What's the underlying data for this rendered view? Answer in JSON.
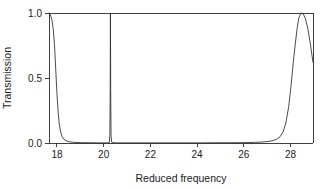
{
  "chart_data": {
    "type": "line",
    "title": "",
    "xlabel": "Reduced frequency",
    "ylabel": "Transmission",
    "xlim": [
      17.66,
      28.96
    ],
    "ylim": [
      0.0,
      1.0
    ],
    "grid": false,
    "legend": "none",
    "xticks": [
      18,
      20,
      22,
      24,
      26,
      28
    ],
    "xtick_labels": [
      "18",
      "20",
      "22",
      "24",
      "26",
      "28"
    ],
    "yticks": [
      0.0,
      0.5,
      1.0
    ],
    "ytick_labels": [
      "0.0",
      "0.5",
      "1.0"
    ],
    "line_color": "#2b2b2b",
    "background_color": "#ffffff",
    "features": [
      {
        "name": "left-band-edge",
        "x": 17.66,
        "peak_value": 1.0
      },
      {
        "name": "narrow-resonance",
        "x": 20.29,
        "peak_value": 1.0,
        "width": 0.04
      },
      {
        "name": "broad-passband",
        "x": 28.35,
        "peak_value": 1.0
      }
    ],
    "series": [
      {
        "name": "Transmission",
        "x": [
          17.66,
          17.72,
          17.78,
          17.84,
          17.9,
          17.95,
          18.0,
          18.05,
          18.1,
          18.16,
          18.22,
          18.3,
          18.4,
          18.52,
          18.66,
          18.82,
          19.0,
          19.2,
          19.45,
          19.7,
          19.95,
          20.15,
          20.24,
          20.265,
          20.28,
          20.29,
          20.3,
          20.315,
          20.34,
          20.43,
          20.6,
          20.9,
          21.3,
          21.8,
          22.4,
          23.0,
          23.6,
          24.2,
          24.8,
          25.4,
          26.0,
          26.5,
          26.9,
          27.2,
          27.4,
          27.55,
          27.68,
          27.8,
          27.92,
          28.02,
          28.12,
          28.2,
          28.28,
          28.35,
          28.44,
          28.54,
          28.64,
          28.74,
          28.84,
          28.96
        ],
        "y": [
          1.0,
          0.985,
          0.95,
          0.88,
          0.74,
          0.56,
          0.38,
          0.24,
          0.145,
          0.085,
          0.05,
          0.028,
          0.016,
          0.01,
          0.006,
          0.004,
          0.003,
          0.002,
          0.002,
          0.001,
          0.001,
          0.001,
          0.003,
          0.06,
          0.42,
          1.0,
          0.42,
          0.06,
          0.006,
          0.002,
          0.001,
          0.001,
          0.001,
          0.001,
          0.001,
          0.001,
          0.001,
          0.001,
          0.002,
          0.002,
          0.003,
          0.005,
          0.009,
          0.016,
          0.028,
          0.048,
          0.085,
          0.155,
          0.28,
          0.44,
          0.63,
          0.76,
          0.88,
          0.96,
          1.0,
          0.995,
          0.955,
          0.88,
          0.77,
          0.62
        ]
      }
    ]
  },
  "axis_titles": {
    "x": "Reduced frequency",
    "y": "Transmission"
  }
}
